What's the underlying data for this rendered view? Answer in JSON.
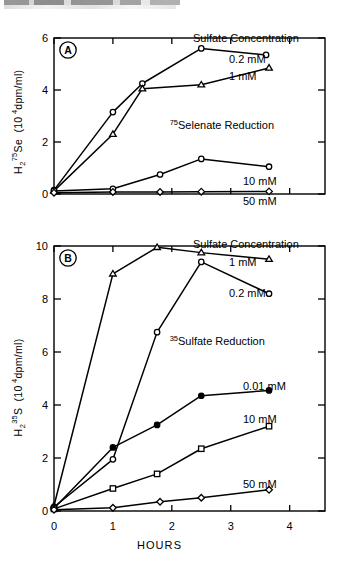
{
  "figure": {
    "header_artifact": "scanned page header (illegible, cropped)",
    "xlabel": "HOURS",
    "xticks": [
      "0",
      "1",
      "2",
      "3",
      "4"
    ],
    "legend_heading": "Sulfate Concentration"
  },
  "chart_data": [
    {
      "type": "line",
      "panel": "A",
      "panel_label": "A",
      "title": "75Selenate Reduction",
      "title_sup": "75",
      "title_rest": "Selenate Reduction",
      "legend_heading": "Sulfate Concentration",
      "xlabel": "HOURS",
      "ylabel": "H2 75Se (104 dpm/ml)",
      "ylabel_parts": {
        "h": "H",
        "sub": "2",
        "sup": "75",
        "el": "Se",
        "units_open": "(10",
        "units_exp": "4",
        "units_rest": " dpm/ml)"
      },
      "xlim": [
        0,
        4.6
      ],
      "ylim": [
        0,
        6.4
      ],
      "xticks": [
        0,
        1,
        2,
        3,
        4
      ],
      "yticks": [
        0,
        2,
        4,
        6
      ],
      "ytick_labels": [
        "0",
        "2",
        "4",
        "6"
      ],
      "grid": false,
      "legend_position": "right-of-curve-ends",
      "series": [
        {
          "name": "0.2 mM",
          "marker": "open-circle",
          "x": [
            0.0,
            1.0,
            1.5,
            2.5,
            3.6
          ],
          "y": [
            0.15,
            3.15,
            4.25,
            5.6,
            5.35
          ]
        },
        {
          "name": "1 mM",
          "marker": "open-triangle",
          "x": [
            0.0,
            1.0,
            1.5,
            2.5,
            3.65
          ],
          "y": [
            0.12,
            2.3,
            4.05,
            4.2,
            4.85
          ]
        },
        {
          "name": "10 mM",
          "marker": "open-circle",
          "x": [
            0.0,
            1.0,
            1.8,
            2.5,
            3.65
          ],
          "y": [
            0.12,
            0.2,
            0.75,
            1.35,
            1.05
          ]
        },
        {
          "name": "50 mM",
          "marker": "open-diamond",
          "x": [
            0.0,
            1.0,
            1.8,
            2.5,
            3.65
          ],
          "y": [
            0.05,
            0.08,
            0.08,
            0.09,
            0.1
          ]
        }
      ]
    },
    {
      "type": "line",
      "panel": "B",
      "panel_label": "B",
      "title": "35Sulfate Reduction",
      "title_sup": "35",
      "title_rest": "Sulfate Reduction",
      "legend_heading": "Sulfate Concentration",
      "xlabel": "HOURS",
      "ylabel": "H2 35S (104 dpm/ml)",
      "ylabel_parts": {
        "h": "H",
        "sub": "2",
        "sup": "35",
        "el": "S",
        "units_open": "(10",
        "units_exp": "4",
        "units_rest": " dpm/ml)"
      },
      "xlim": [
        0,
        4.6
      ],
      "ylim": [
        0,
        10.6
      ],
      "xticks": [
        0,
        1,
        2,
        3,
        4
      ],
      "yticks": [
        0,
        2,
        4,
        6,
        8,
        10
      ],
      "ytick_labels": [
        "0",
        "2",
        "4",
        "6",
        "8",
        "10"
      ],
      "grid": false,
      "legend_position": "right-of-curve-ends",
      "series": [
        {
          "name": "1 mM",
          "marker": "open-triangle",
          "x": [
            0.0,
            1.0,
            1.75,
            2.5,
            3.65
          ],
          "y": [
            0.2,
            8.95,
            9.95,
            9.75,
            9.5
          ]
        },
        {
          "name": "0.2 mM",
          "marker": "open-circle",
          "x": [
            0.0,
            1.0,
            1.75,
            2.5,
            3.65
          ],
          "y": [
            0.15,
            1.95,
            6.75,
            9.4,
            8.2
          ]
        },
        {
          "name": "0.01 mM",
          "marker": "filled-circle",
          "x": [
            0.0,
            1.0,
            1.75,
            2.5,
            3.65
          ],
          "y": [
            0.1,
            2.4,
            3.25,
            4.35,
            4.55
          ]
        },
        {
          "name": "10 mM",
          "marker": "open-square",
          "x": [
            0.0,
            1.0,
            1.75,
            2.5,
            3.65
          ],
          "y": [
            0.08,
            0.85,
            1.4,
            2.35,
            3.2
          ]
        },
        {
          "name": "50 mM",
          "marker": "open-diamond",
          "x": [
            0.0,
            1.0,
            1.8,
            2.5,
            3.65
          ],
          "y": [
            0.05,
            0.12,
            0.35,
            0.5,
            0.8
          ]
        }
      ]
    }
  ]
}
